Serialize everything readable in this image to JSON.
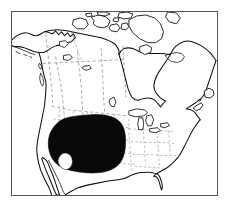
{
  "figure": {
    "kind": "range-map",
    "background_color": "#ffffff",
    "frame": {
      "border_color": "#555555",
      "border_width_px": 1.4,
      "left_px": 11,
      "top_px": 11,
      "width_px": 207,
      "height_px": 185
    }
  },
  "legend_text": "",
  "labels": [],
  "map": {
    "projection_note": "conic, North America",
    "continent_name": "North America",
    "features": [
      {
        "name": "mainland-coastline",
        "type": "coastline",
        "stroke_color": "#111111",
        "description": "Continental outline of North America including Alaska, Canada, the contiguous United States and northern Mexico"
      },
      {
        "name": "arctic-archipelago",
        "type": "islands",
        "stroke_color": "#111111",
        "description": "Canadian Arctic Archipelago: Banks, Victoria, Baffin and surrounding islands"
      },
      {
        "name": "hudson-bay",
        "type": "bay",
        "stroke_color": "#111111",
        "description": "Hudson Bay and James Bay inlet"
      },
      {
        "name": "great-lakes",
        "type": "lakes",
        "stroke_color": "#111111",
        "description": "Laurentian Great Lakes"
      },
      {
        "name": "baja-california",
        "type": "peninsula",
        "stroke_color": "#111111",
        "description": "Baja California peninsula and Gulf of California"
      },
      {
        "name": "florida-peninsula",
        "type": "peninsula",
        "stroke_color": "#111111",
        "description": "Florida peninsula"
      },
      {
        "name": "newfoundland",
        "type": "island",
        "stroke_color": "#111111",
        "description": "Island of Newfoundland off the Gulf of St. Lawrence"
      },
      {
        "name": "internal-boundaries",
        "type": "administrative-borders",
        "stroke_color": "#8d8d8d",
        "line_style": "dashed",
        "description": "Dashed state and provincial boundary lines"
      }
    ],
    "range_overlay": {
      "name": "distribution-range",
      "fill_color": "#080808",
      "shape": "solid filled blob",
      "region_description": "Great Plains and intermountain West of the United States, extending from southern Canadian prairies south to northern Mexico and from the Rocky Mountains east to the Mississippi valley",
      "has_interior_gap": true,
      "interior_gap_description": "Small unshaded notch on the southwest margin near the Colorado Plateau",
      "approx_extent_px": {
        "left": 45,
        "top": 115,
        "right": 127,
        "bottom": 178
      }
    }
  }
}
